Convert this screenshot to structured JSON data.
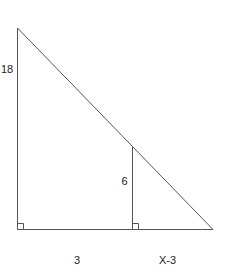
{
  "diagram": {
    "labels": {
      "outer_height": "18",
      "inner_height": "6",
      "left_base": "3",
      "right_base": "X-3"
    },
    "colors": {
      "stroke": "#555555",
      "text": "#222222",
      "background": "#ffffff"
    },
    "points": {
      "top_vertex": [
        17,
        28
      ],
      "bottom_left": [
        17,
        229
      ],
      "inner_top": [
        132,
        147
      ],
      "inner_bottom": [
        132,
        229
      ],
      "bottom_right": [
        213,
        229
      ]
    }
  }
}
